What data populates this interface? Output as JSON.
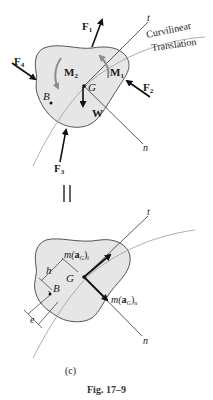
{
  "figure": {
    "caption": "Fig. 17–9",
    "subfigure_label": "(c)",
    "equals_sign": "||"
  },
  "top_diagram": {
    "path_label_line1": "Curvilinear",
    "path_label_line2": "Translation",
    "axis_t": "t",
    "axis_n": "n",
    "center_of_mass": "G",
    "point_B": "B",
    "forces": [
      {
        "label": "F",
        "sub": "1"
      },
      {
        "label": "F",
        "sub": "2"
      },
      {
        "label": "F",
        "sub": "3"
      },
      {
        "label": "F",
        "sub": "4"
      }
    ],
    "moments": [
      {
        "label": "M",
        "sub": "1"
      },
      {
        "label": "M",
        "sub": "2"
      }
    ],
    "weight": "W"
  },
  "bottom_diagram": {
    "axis_t": "t",
    "axis_n": "n",
    "center_of_mass": "G",
    "point_B": "B",
    "dim_h": "h",
    "dim_e": "e",
    "inertia_t": {
      "prefix": "m(",
      "vec": "a",
      "sub": "G",
      "suffix": ")",
      "subscript": "t"
    },
    "inertia_n": {
      "prefix": "m(",
      "vec": "a",
      "sub": "G",
      "suffix": ")",
      "subscript": "n"
    }
  },
  "colors": {
    "body_fill": "#e6e6e6",
    "outline": "#555555",
    "arrow": "#111111",
    "moment_arrow": "#8c8c8c",
    "path_curve": "#9a9a9a"
  }
}
